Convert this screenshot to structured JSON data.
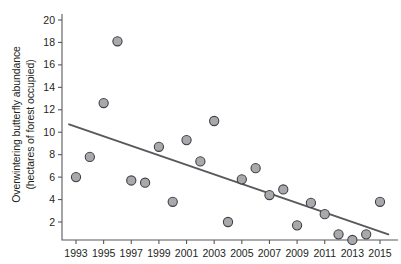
{
  "chart_data": {
    "type": "scatter",
    "title": "",
    "xlabel": "",
    "ylabel": "Overwintering butterfly abundance (hectares of forest occupied)",
    "ylabel_line1": "Overwintering butterfly abundance",
    "ylabel_line2": "(hectares of forest occupied)",
    "x": [
      1993,
      1994,
      1995,
      1996,
      1997,
      1998,
      1999,
      2000,
      2001,
      2002,
      2003,
      2004,
      2005,
      2006,
      2007,
      2008,
      2009,
      2010,
      2011,
      2012,
      2013,
      2014,
      2015
    ],
    "values": [
      6.0,
      7.8,
      12.6,
      18.1,
      5.7,
      5.5,
      8.7,
      3.8,
      9.3,
      7.4,
      11.0,
      2.0,
      5.8,
      6.8,
      4.4,
      4.9,
      1.7,
      3.7,
      2.7,
      0.9,
      0.4,
      0.9,
      3.8
    ],
    "series": [
      {
        "name": "Overwintering butterfly abundance",
        "values": [
          6.0,
          7.8,
          12.6,
          18.1,
          5.7,
          5.5,
          8.7,
          3.8,
          9.3,
          7.4,
          11.0,
          2.0,
          5.8,
          6.8,
          4.4,
          4.9,
          1.7,
          3.7,
          2.7,
          0.9,
          0.4,
          0.9,
          3.8
        ]
      }
    ],
    "trendline": {
      "type": "linear",
      "x_start": 1992.5,
      "y_start": 10.7,
      "x_end": 2015.6,
      "y_end": 0.9
    },
    "xlim": [
      1992.3,
      2015.9
    ],
    "ylim": [
      0,
      21
    ],
    "xticks": [
      1993,
      1995,
      1997,
      1999,
      2001,
      2003,
      2005,
      2007,
      2009,
      2011,
      2013,
      2015
    ],
    "xtick_labels": [
      "1993",
      "1995",
      "1997",
      "1999",
      "2001",
      "2003",
      "2005",
      "2007",
      "2009",
      "2011",
      "2013",
      "2015"
    ],
    "xticks_minor": [
      1994,
      1996,
      1998,
      2000,
      2002,
      2004,
      2006,
      2008,
      2010,
      2012,
      2014
    ],
    "yticks": [
      2,
      4,
      6,
      8,
      10,
      12,
      14,
      16,
      18,
      20
    ],
    "ytick_labels": [
      "2",
      "4",
      "6",
      "8",
      "10",
      "12",
      "14",
      "16",
      "18",
      "20"
    ],
    "grid": false,
    "legend": null,
    "colors": {
      "marker_fill": "#a7a9ac",
      "marker_stroke": "#414042",
      "axis": "#58595b",
      "trendline": "#58595b",
      "text": "#231f20",
      "background": "#ffffff"
    }
  }
}
